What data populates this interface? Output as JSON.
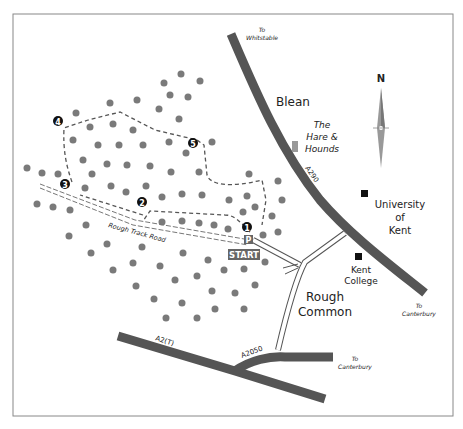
{
  "map": {
    "labels": {
      "to_whitstable_1": "To",
      "to_whitstable_2": "Whitstable",
      "blean": "Blean",
      "pub_1": "The",
      "pub_2": "Hare &",
      "pub_3": "Hounds",
      "a290": "A290",
      "uni_1": "University",
      "uni_2": "of",
      "uni_3": "Kent",
      "college_1": "Kent",
      "college_2": "College",
      "rough_1": "Rough",
      "rough_2": "Common",
      "to_cant_1a": "To",
      "to_cant_1b": "Canterbury",
      "to_cant_2a": "To",
      "to_cant_2b": "Canterbury",
      "a2t": "A2(T)",
      "a2050": "A2050",
      "track": "Rough Track Road",
      "start": "START",
      "parking": "P",
      "north": "N"
    },
    "waypoints": [
      "1",
      "2",
      "3",
      "4",
      "5"
    ],
    "colors": {
      "road": "#555555",
      "tree": "#7a7a7a",
      "route": "#555555",
      "border": "#888888"
    }
  }
}
